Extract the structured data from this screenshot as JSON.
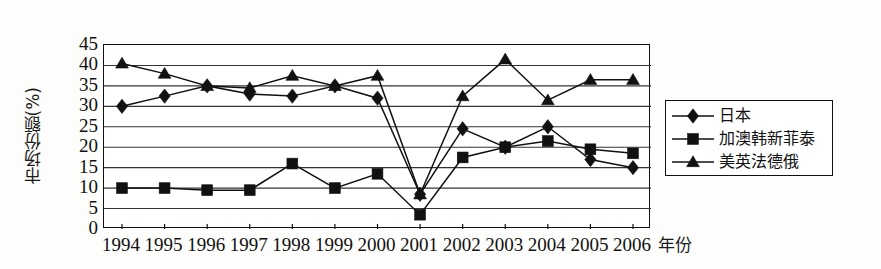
{
  "chart_data": {
    "type": "line",
    "title": "",
    "xlabel": "年份",
    "ylabel": "市场份额(%)",
    "categories": [
      "1994",
      "1995",
      "1996",
      "1997",
      "1998",
      "1999",
      "2000",
      "2001",
      "2002",
      "2003",
      "2004",
      "2005",
      "2006"
    ],
    "ylim": [
      0,
      45
    ],
    "ytick_labels": [
      "0",
      "5",
      "10",
      "15",
      "20",
      "25",
      "30",
      "35",
      "40",
      "45"
    ],
    "ytick_values": [
      0,
      5,
      10,
      15,
      20,
      25,
      30,
      35,
      40,
      45
    ],
    "grid": "horizontal",
    "legend_position": "right-outside",
    "series": [
      {
        "name": "日本",
        "marker": "diamond",
        "values": [
          30,
          32.5,
          35,
          33,
          32.5,
          35,
          32,
          8.5,
          24.5,
          20,
          25,
          17,
          15
        ]
      },
      {
        "name": "加澳韩新菲泰",
        "marker": "square",
        "values": [
          10,
          10,
          9.5,
          9.5,
          16,
          10,
          13.5,
          3.5,
          17.5,
          20,
          21.5,
          19.5,
          18.5
        ]
      },
      {
        "name": "美英法德俄",
        "marker": "triangle",
        "values": [
          40.5,
          38,
          35,
          34.5,
          37.5,
          35,
          37.5,
          8.5,
          32.5,
          41.5,
          31.5,
          36.5,
          36.5
        ]
      }
    ],
    "colors": {
      "line": "#111111",
      "grid": "#333333",
      "axis": "#111111",
      "background": "#ffffff"
    }
  },
  "legend": {
    "items": [
      {
        "label": "日本",
        "marker": "diamond"
      },
      {
        "label": "加澳韩新菲泰",
        "marker": "square"
      },
      {
        "label": "美英法德俄",
        "marker": "triangle"
      }
    ]
  }
}
